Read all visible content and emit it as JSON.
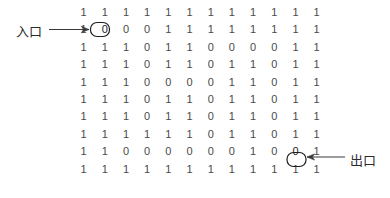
{
  "figure": {
    "grid": {
      "rows": 10,
      "cols": 12,
      "cells": [
        [
          "1",
          "1",
          "1",
          "1",
          "1",
          "1",
          "1",
          "1",
          "1",
          "1",
          "1",
          "1"
        ],
        [
          "1",
          "0",
          "0",
          "0",
          "1",
          "1",
          "1",
          "1",
          "1",
          "1",
          "1",
          "1"
        ],
        [
          "1",
          "1",
          "1",
          "0",
          "1",
          "1",
          "0",
          "0",
          "0",
          "0",
          "1",
          "1"
        ],
        [
          "1",
          "1",
          "1",
          "0",
          "1",
          "1",
          "0",
          "1",
          "1",
          "0",
          "1",
          "1"
        ],
        [
          "1",
          "1",
          "1",
          "0",
          "0",
          "0",
          "0",
          "1",
          "1",
          "0",
          "1",
          "1"
        ],
        [
          "1",
          "1",
          "1",
          "0",
          "1",
          "1",
          "0",
          "1",
          "1",
          "0",
          "1",
          "1"
        ],
        [
          "1",
          "1",
          "1",
          "0",
          "1",
          "1",
          "0",
          "1",
          "1",
          "0",
          "1",
          "1"
        ],
        [
          "1",
          "1",
          "1",
          "1",
          "1",
          "1",
          "0",
          "1",
          "1",
          "0",
          "1",
          "1"
        ],
        [
          "1",
          "1",
          "0",
          "0",
          "0",
          "0",
          "0",
          "0",
          "1",
          "0",
          "0",
          "1"
        ],
        [
          "1",
          "1",
          "1",
          "1",
          "1",
          "1",
          "1",
          "1",
          "1",
          "1",
          "1",
          "1"
        ]
      ]
    },
    "annotations": {
      "entry": {
        "label": "入口",
        "marked_row": 1,
        "marked_col": 1,
        "marked_value": "0",
        "arrow_direction": "right"
      },
      "exit": {
        "label": "出口",
        "marked_row": 8,
        "marked_col": 10,
        "marked_value": "0",
        "arrow_direction": "left"
      }
    },
    "colors": {
      "digit": "#4a4a4a",
      "label": "#2b2b2b",
      "line": "#3a3a3a",
      "background": "#ffffff"
    }
  }
}
